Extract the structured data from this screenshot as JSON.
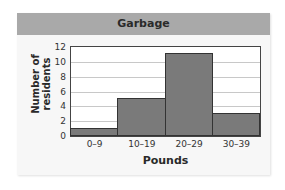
{
  "chart_data": {
    "type": "bar",
    "title": "Garbage",
    "xlabel": "Pounds",
    "ylabel": "Number of residents",
    "categories": [
      "0–9",
      "10–19",
      "20–29",
      "30–39"
    ],
    "values": [
      1,
      5,
      11,
      3
    ],
    "ylim": [
      0,
      12
    ],
    "yticks": [
      "0",
      "2",
      "4",
      "6",
      "8",
      "10",
      "12"
    ],
    "grid": true,
    "legend": "none",
    "histogram": true
  },
  "labels": {
    "title": "Garbage",
    "xlabel": "Pounds",
    "ylabel_line1": "Number of",
    "ylabel_line2": "residents"
  },
  "colors": {
    "header": "#a9a9a9",
    "bar": "#7a7a7a",
    "panel": "#f7f7f7"
  }
}
